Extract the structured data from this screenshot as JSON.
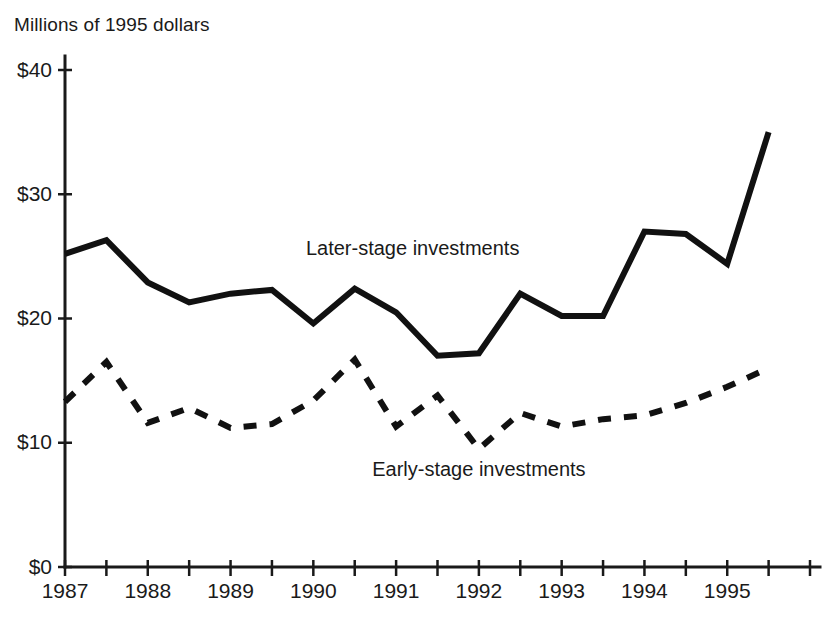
{
  "chart_data": {
    "type": "line",
    "title": "",
    "ylabel": "Millions of 1995 dollars",
    "xlabel": "",
    "ylim": [
      0,
      40
    ],
    "xlim": [
      1987,
      1996
    ],
    "grid": false,
    "legend_position": "inline-annotation",
    "y_ticks": [
      "$0",
      "$10",
      "$20",
      "$30",
      "$40"
    ],
    "y_tick_values": [
      0,
      10,
      20,
      30,
      40
    ],
    "x_ticks": [
      "1987",
      "1988",
      "1989",
      "1990",
      "1991",
      "1992",
      "1993",
      "1994",
      "1995"
    ],
    "x_tick_values": [
      1987,
      1988,
      1989,
      1990,
      1991,
      1992,
      1993,
      1994,
      1995
    ],
    "x_minor_interval": 0.5,
    "x": [
      1987.0,
      1987.5,
      1988.0,
      1988.5,
      1989.0,
      1989.5,
      1990.0,
      1990.5,
      1991.0,
      1991.5,
      1992.0,
      1992.5,
      1993.0,
      1993.5,
      1994.0,
      1994.5,
      1995.0,
      1995.5
    ],
    "series": [
      {
        "name": "Later-stage investments",
        "style": "solid",
        "color": "#111111",
        "label_x": 1991.2,
        "label_y": 25.1,
        "values": [
          25.2,
          26.3,
          22.9,
          21.3,
          22.0,
          22.3,
          19.6,
          22.4,
          20.5,
          17.0,
          17.2,
          22.0,
          20.2,
          20.2,
          27.0,
          26.8,
          24.4,
          35.0
        ]
      },
      {
        "name": "Early-stage investments",
        "style": "dashed",
        "color": "#111111",
        "label_x": 1992.0,
        "label_y": 7.3,
        "values": [
          13.3,
          16.5,
          11.6,
          12.8,
          11.2,
          11.5,
          13.4,
          16.7,
          11.3,
          13.8,
          9.5,
          12.4,
          11.3,
          11.9,
          12.2,
          13.2,
          14.5,
          16.0
        ]
      }
    ]
  }
}
